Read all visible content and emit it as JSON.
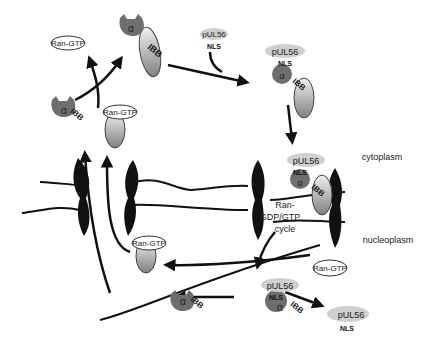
{
  "labels": {
    "cytoplasm": "cytoplasm",
    "nucleoplasm": "nucleoplasm",
    "ran_cycle_1": "Ran-",
    "ran_cycle_2": "GDP/GTP",
    "ran_cycle_3": "cycle",
    "ran_gtp": "Ran-GTP",
    "cargo": "pUL56",
    "nls": "NLS",
    "alpha": "α",
    "beta": "β",
    "ibb": "IBB"
  },
  "colors": {
    "alpha": "#6e6e6e",
    "beta_top": "#e8e8e8",
    "beta_bottom": "#8a8a8a",
    "cargo": "#cfcfcf",
    "line": "#111111"
  }
}
